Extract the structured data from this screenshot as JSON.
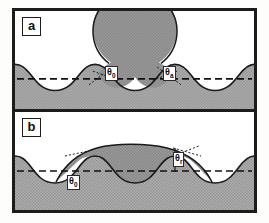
{
  "figure": {
    "background_color": "#fdfdfb",
    "frame_color": "#1c1c1c",
    "solid_fill_color": "#a8a8a8",
    "liquid_fill_color": "#8f8f8f",
    "void_fill_color": "#ffffff",
    "dashed_line_color": "#111111"
  },
  "panels": [
    {
      "tag": "a",
      "caption": "advancing drop resting on wavy solid surface",
      "labels": [
        {
          "name": "theta-zero",
          "theta": "θ",
          "subscript": "0"
        },
        {
          "name": "theta-advancing",
          "theta": "θ",
          "subscript": "a"
        }
      ],
      "drop_shape": "circular cap",
      "dashed_line": "mean surface level"
    },
    {
      "tag": "b",
      "caption": "receding drop spread across wavy solid surface",
      "labels": [
        {
          "name": "theta-zero",
          "theta": "θ",
          "subscript": "0"
        },
        {
          "name": "theta-receding",
          "theta": "θ",
          "subscript": "r"
        }
      ],
      "drop_shape": "flattened spread cap",
      "dashed_line": "mean surface level"
    }
  ]
}
